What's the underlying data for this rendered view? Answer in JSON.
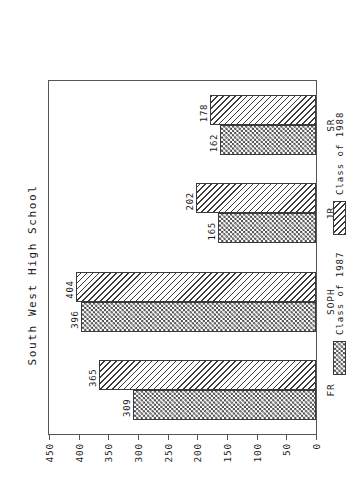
{
  "chart_data": {
    "type": "bar",
    "title": "South West High School",
    "xlabel": "",
    "ylabel": "",
    "orientation": "vertical-grouped",
    "grid": false,
    "legend_position": "bottom",
    "categories": [
      "FR",
      "SOPH",
      "JR",
      "SR"
    ],
    "series": [
      {
        "name": "Class of 1987",
        "pattern": "checkerboard",
        "values": [
          309,
          396,
          165,
          162
        ]
      },
      {
        "name": "Class of 1988",
        "pattern": "diagonal-hatch",
        "values": [
          365,
          404,
          202,
          178
        ]
      }
    ],
    "ylim": [
      0,
      450
    ],
    "yticks": [
      0,
      50,
      100,
      150,
      200,
      250,
      300,
      350,
      400,
      450
    ],
    "ytick_labels": [
      "0",
      "50",
      "100",
      "150",
      "200",
      "250",
      "300",
      "350",
      "400",
      "450"
    ],
    "data_labels": {
      "FR": {
        "Class of 1987": "309",
        "Class of 1988": "365"
      },
      "SOPH": {
        "Class of 1987": "396",
        "Class of 1988": "404"
      },
      "JR": {
        "Class of 1987": "165",
        "Class of 1988": "202"
      },
      "SR": {
        "Class of 1987": "162",
        "Class of 1988": "178"
      }
    },
    "colors": {
      "ink": "#3a3a3a",
      "frame": "#555555",
      "background": "#ffffff"
    }
  },
  "legend": {
    "items": [
      {
        "label": "Class of 1987"
      },
      {
        "label": "Class of 1988"
      }
    ]
  }
}
